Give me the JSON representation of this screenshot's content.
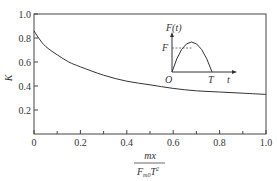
{
  "chart_data": {
    "type": "line",
    "title": "",
    "xlabel_numerator": "mx",
    "xlabel_denominator_main": "F",
    "xlabel_denominator_sub": "m0",
    "xlabel_denominator_tail": "T",
    "xlabel_denominator_sup": "2",
    "ylabel": "K",
    "xlim": [
      0,
      1.0
    ],
    "ylim": [
      0,
      1.0
    ],
    "xticks": [
      "0",
      "0.2",
      "0.4",
      "0.6",
      "0.8",
      "1.0"
    ],
    "yticks": [
      "0.2",
      "0.4",
      "0.6",
      "0.8",
      "1.0"
    ],
    "grid": false,
    "series": [
      {
        "name": "K",
        "x": [
          0.0,
          0.02,
          0.05,
          0.1,
          0.15,
          0.2,
          0.3,
          0.4,
          0.5,
          0.6,
          0.7,
          0.8,
          0.9,
          1.0
        ],
        "y": [
          0.86,
          0.8,
          0.73,
          0.66,
          0.6,
          0.56,
          0.49,
          0.44,
          0.41,
          0.38,
          0.36,
          0.35,
          0.34,
          0.33
        ]
      }
    ],
    "inset": {
      "ylabel": "F(t)",
      "xlabel": "t",
      "origin_label": "O",
      "peak_label": "F",
      "end_label": "T",
      "shape": "half-sine pulse"
    }
  }
}
